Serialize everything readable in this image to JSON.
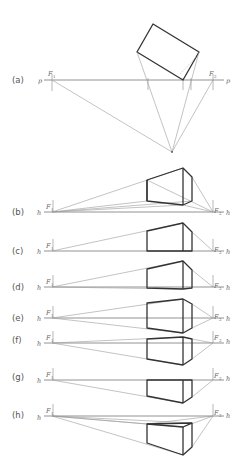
{
  "figure": {
    "panels": [
      {
        "id": "a",
        "label": "(a)",
        "line_label": "p",
        "f1": "F",
        "f1_sub": "1",
        "f2": "F",
        "f2_sub": "2"
      },
      {
        "id": "b",
        "label": "(b)",
        "line_label": "h",
        "f1": "F",
        "f1_sub": "1",
        "f2": "F",
        "f2_sub": "2"
      },
      {
        "id": "c",
        "label": "(c)",
        "line_label": "h",
        "f1": "F",
        "f1_sub": "1",
        "f2": "F",
        "f2_sub": "2"
      },
      {
        "id": "d",
        "label": "(d)",
        "line_label": "h",
        "f1": "F",
        "f1_sub": "1",
        "f2": "F",
        "f2_sub": "2"
      },
      {
        "id": "e",
        "label": "(e)",
        "line_label": "h",
        "f1": "F",
        "f1_sub": "1",
        "f2": "F",
        "f2_sub": "2"
      },
      {
        "id": "f",
        "label": "(f)",
        "line_label": "h",
        "f1": "F",
        "f1_sub": "1",
        "f2": "F",
        "f2_sub": "2"
      },
      {
        "id": "g",
        "label": "(g)",
        "line_label": "h",
        "f1": "F",
        "f1_sub": "1",
        "f2": "F",
        "f2_sub": "2"
      },
      {
        "id": "h",
        "label": "(h)",
        "line_label": "h",
        "f1": "F",
        "f1_sub": "1",
        "f2": "F",
        "f2_sub": "2"
      }
    ],
    "colors": {
      "construction": "#9a9a9a",
      "object": "#333333",
      "text": "#555555"
    }
  }
}
